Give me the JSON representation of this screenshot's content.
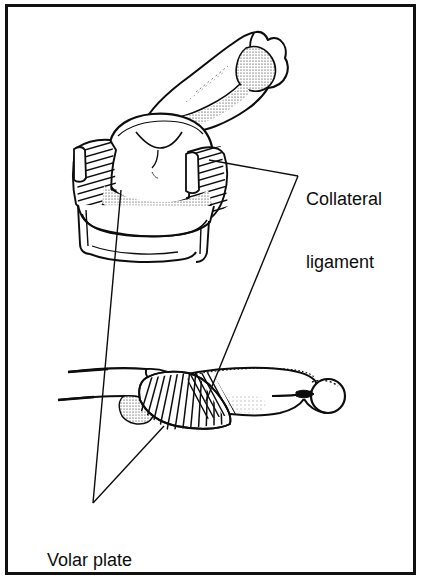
{
  "figure": {
    "kind": "anatomical-line-illustration",
    "background_color": "#ffffff",
    "ink_color": "#0d0d0d",
    "frame": {
      "border_color": "#111111",
      "border_width_px": 3,
      "present": true
    }
  },
  "labels": {
    "collateral_ligament": {
      "line1": "Collateral",
      "line2": "ligament",
      "full_text": "Collateral ligament",
      "x": 306,
      "y": 147,
      "font_size_px": 18
    },
    "volar_plate": {
      "line1": "Volar plate",
      "full_text": "Volar plate",
      "x": 47,
      "y": 508,
      "font_size_px": 18
    }
  },
  "leader_lines": {
    "collateral_ligament": {
      "vertex": [
        298,
        176
      ],
      "targets": [
        [
          209,
          160
        ],
        [
          206,
          401
        ]
      ],
      "stroke_color": "#0d0d0d",
      "stroke_width": 1.4
    },
    "volar_plate": {
      "vertex": [
        93,
        503
      ],
      "targets": [
        [
          121,
          190
        ],
        [
          164,
          426
        ]
      ],
      "stroke_color": "#0d0d0d",
      "stroke_width": 1.4
    }
  },
  "views": {
    "upper": {
      "name": "oblique-view",
      "description": "proximal phalanx head with collateral ligaments and volar plate seen obliquely",
      "parts": [
        "distal-phalanx-shaft",
        "condylar-head",
        "collateral-ligament-left",
        "collateral-ligament-right",
        "volar-plate-surface",
        "base-of-middle-phalanx"
      ]
    },
    "lower": {
      "name": "lateral-view",
      "description": "lateral profile of the joint showing fanned volar plate fibers and terminal knob",
      "parts": [
        "proximal-phalanx-profile",
        "joint-space",
        "volar-plate-fibers",
        "middle-phalanx-profile",
        "terminal-knob"
      ]
    }
  }
}
